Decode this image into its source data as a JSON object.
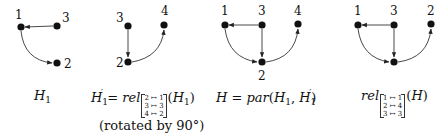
{
  "diagram": {
    "graphs": [
      {
        "id": "H1",
        "nodes": [
          {
            "label": "1",
            "x": 21,
            "y": 27,
            "lx": 15,
            "ly": 19
          },
          {
            "label": "3",
            "x": 57,
            "y": 26,
            "lx": 62,
            "ly": 22
          },
          {
            "label": "2",
            "x": 57,
            "y": 63,
            "lx": 64,
            "ly": 68
          }
        ],
        "edges": [
          {
            "from": "3",
            "to": "1",
            "shape": "straight"
          },
          {
            "from": "1",
            "to": "2",
            "shape": "curve"
          }
        ],
        "caption": {
          "main": "H",
          "sub": "1"
        }
      },
      {
        "id": "H1prime",
        "nodes": [
          {
            "label": "3",
            "x": 128,
            "y": 26,
            "lx": 116,
            "ly": 22
          },
          {
            "label": "4",
            "x": 164,
            "y": 25,
            "lx": 161,
            "ly": 15
          },
          {
            "label": "2",
            "x": 128,
            "y": 62,
            "lx": 116,
            "ly": 67
          }
        ],
        "edges": [
          {
            "from": "3",
            "to": "2",
            "shape": "straight"
          },
          {
            "from": "2",
            "to": "4",
            "shape": "curve"
          }
        ],
        "caption": {
          "lhs": "H",
          "lhs_sub": "1",
          "lhs_prime": "′",
          "eq": " = ",
          "fn": "rel",
          "mapping": [
            "2 ↦ 1",
            "3 ↦ 3",
            "4 ↦ 2"
          ],
          "arg_open": "(",
          "arg": "H",
          "arg_sub": "1",
          "arg_close": ")",
          "note": "(rotated by 90°)"
        }
      },
      {
        "id": "H",
        "nodes": [
          {
            "label": "1",
            "x": 225,
            "y": 25,
            "lx": 221,
            "ly": 15
          },
          {
            "label": "3",
            "x": 262,
            "y": 25,
            "lx": 258,
            "ly": 15
          },
          {
            "label": "4",
            "x": 298,
            "y": 24,
            "lx": 294,
            "ly": 15
          },
          {
            "label": "2",
            "x": 262,
            "y": 62,
            "lx": 258,
            "ly": 80
          }
        ],
        "edges": [
          {
            "from": "3",
            "to": "1",
            "shape": "straight"
          },
          {
            "from": "3",
            "to": "2",
            "shape": "straight"
          },
          {
            "from": "1",
            "to": "2",
            "shape": "curve"
          },
          {
            "from": "2",
            "to": "4",
            "shape": "curve"
          }
        ],
        "caption": {
          "lhs": "H",
          "eq": " = ",
          "fn": "par",
          "args_open": "(",
          "a1": "H",
          "a1_sub": "1",
          "sep": ", ",
          "a2": "H",
          "a2_sub": "1",
          "a2_prime": "′",
          "args_close": ")"
        }
      },
      {
        "id": "relH",
        "nodes": [
          {
            "label": "1",
            "x": 358,
            "y": 25,
            "lx": 354,
            "ly": 15
          },
          {
            "label": "3",
            "x": 394,
            "y": 25,
            "lx": 390,
            "ly": 15
          },
          {
            "label": "2",
            "x": 431,
            "y": 24,
            "lx": 427,
            "ly": 15
          },
          {
            "label": "",
            "x": 394,
            "y": 62,
            "lx": 0,
            "ly": 0
          }
        ],
        "edges": [
          {
            "from": "3",
            "to": "1",
            "shape": "straight"
          },
          {
            "from": "3",
            "to": "b",
            "shape": "straight"
          },
          {
            "from": "1",
            "to": "b",
            "shape": "curve"
          },
          {
            "from": "b",
            "to": "2",
            "shape": "curve"
          }
        ],
        "caption": {
          "fn": "rel",
          "mapping": [
            "1 ↦ 1",
            "2 ↦ 4",
            "3 ↦ 3"
          ],
          "arg_open": "(",
          "arg": "H",
          "arg_close": ")"
        }
      }
    ],
    "colors": {
      "node": "#111111",
      "edge": "#333333",
      "background": "#ffffff"
    }
  }
}
